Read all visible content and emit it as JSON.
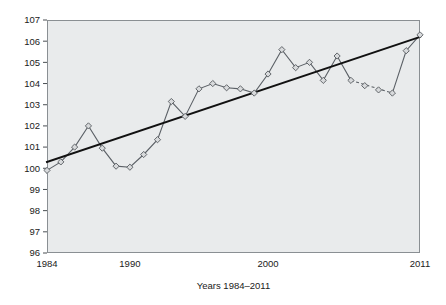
{
  "chart_data": {
    "type": "line",
    "title": "",
    "xlabel": "Years 1984–2011",
    "ylabel": "",
    "xlim": [
      1984,
      2011
    ],
    "ylim": [
      96,
      107
    ],
    "grid": false,
    "legend": "none",
    "x_tick_labels": [
      "1984",
      "1990",
      "2000",
      "2011"
    ],
    "x_tick_values": [
      1984,
      1990,
      2000,
      2011
    ],
    "y_tick_labels": [
      "96",
      "97",
      "98",
      "99",
      "100",
      "101",
      "102",
      "103",
      "104",
      "105",
      "106",
      "107"
    ],
    "y_tick_values": [
      96,
      97,
      98,
      99,
      100,
      101,
      102,
      103,
      104,
      105,
      106,
      107
    ],
    "x": [
      1984,
      1985,
      1986,
      1987,
      1988,
      1989,
      1990,
      1991,
      1992,
      1993,
      1994,
      1995,
      1996,
      1997,
      1998,
      1999,
      2000,
      2001,
      2002,
      2003,
      2004,
      2005,
      2006,
      2007,
      2008,
      2009,
      2010,
      2011
    ],
    "series": [
      {
        "name": "Index",
        "style": "solid-with-markers",
        "marker": "diamond",
        "values": [
          99.9,
          100.3,
          101.0,
          102.0,
          100.95,
          100.1,
          100.05,
          100.65,
          101.35,
          103.15,
          102.45,
          103.75,
          104.0,
          103.8,
          103.75,
          103.55,
          104.45,
          105.6,
          104.75,
          105.0,
          104.15,
          105.3,
          104.15,
          103.9,
          103.7,
          103.55,
          105.55,
          106.3
        ],
        "dashed_segment": {
          "from_year": 2006,
          "to_year": 2009,
          "from_value": 104.15,
          "to_value": 103.55,
          "note": "interpolated / projected segment drawn dashed"
        }
      },
      {
        "name": "Linear trend",
        "style": "solid-thick",
        "marker": "none",
        "endpoints": [
          {
            "x": 1984,
            "y": 100.3
          },
          {
            "x": 2011,
            "y": 106.2
          }
        ]
      }
    ]
  },
  "axis": {
    "x_title": "Years 1984–2011"
  },
  "colors": {
    "plot_background": "#e9ebec",
    "frame": "#8a8f93",
    "series_line": "#5b6066",
    "marker_fill": "#d8dadc",
    "marker_stroke": "#55595e",
    "trend_line": "#111111",
    "text": "#1a1a1a"
  }
}
